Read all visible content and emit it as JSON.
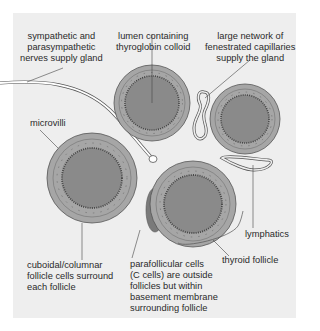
{
  "figure": {
    "type": "thyroid follicle histology diagram",
    "colors": {
      "panel_bg": "#eeeeee",
      "cell_layer": "#a6a6a6",
      "colloid": "#8a8a8a",
      "cell_outline": "#555555",
      "parafollicular": "#7a7a7a",
      "text": "#2a2a2a"
    },
    "labels": {
      "nerves": "sympathetic and\nparasympathetic\nnerves supply gland",
      "lumen": "lumen containing\nthyroglobin colloid",
      "capillaries": "large network of\nfenestrated capillaries\nsupply the gland",
      "microvilli": "microvilli",
      "cuboidal": "cuboidal/columnar\nfollicle cells surround\neach follicle",
      "parafollicular": "parafollicular cells\n(C cells) are outside\nfollicles but within\nbasement membrane\nsurrounding follicle",
      "thyroid_follicle": "thyroid follicle",
      "lymphatics": "lymphatics"
    }
  }
}
